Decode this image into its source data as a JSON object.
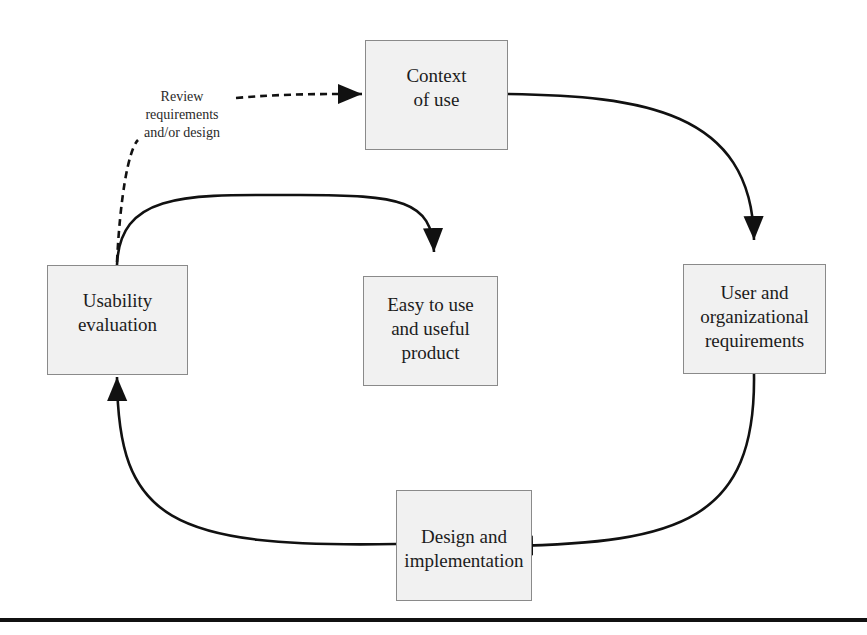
{
  "diagram": {
    "title": "",
    "nodes": {
      "context": {
        "label": "Context\nof use"
      },
      "usability": {
        "label": "Usability\nevaluation"
      },
      "product": {
        "label": "Easy to use\nand useful\nproduct"
      },
      "requirements": {
        "label": "User and\norganizational\nrequirements"
      },
      "design": {
        "label": "Design and\nimplementation"
      }
    },
    "edges": [
      {
        "from": "context",
        "to": "requirements",
        "style": "solid"
      },
      {
        "from": "requirements",
        "to": "design",
        "style": "solid"
      },
      {
        "from": "design",
        "to": "usability",
        "style": "solid"
      },
      {
        "from": "usability",
        "to": "product",
        "style": "solid"
      },
      {
        "from": "usability",
        "to": "context",
        "style": "dashed",
        "label": "Review\nrequirements\nand/or design"
      }
    ],
    "colors": {
      "box_fill": "#f1f1f1",
      "box_border": "#8a8a8a",
      "arrow": "#111111",
      "text": "#1c1c1c"
    }
  }
}
